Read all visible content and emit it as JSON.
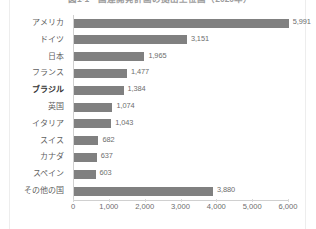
{
  "figure": {
    "title": "図1-1　国連開発計画の拠出上位国（2020年）",
    "title_clipped": true,
    "bar_color": "#808080",
    "axis_color": "#d0d0d0",
    "highlight_category": "ブラジル"
  },
  "chart_data": {
    "type": "bar",
    "orientation": "horizontal",
    "title": "図1-1　国連開発計画の拠出上位国（2020年）",
    "xlabel": "",
    "ylabel": "",
    "categories": [
      "アメリカ",
      "ドイツ",
      "日本",
      "フランス",
      "ブラジル",
      "英国",
      "イタリア",
      "スイス",
      "カナダ",
      "スペイン",
      "その他の国"
    ],
    "values": [
      5991,
      3151,
      1965,
      1477,
      1384,
      1074,
      1043,
      682,
      637,
      603,
      3880
    ],
    "value_labels": [
      "5,991",
      "3,151",
      "1,965",
      "1,477",
      "1,384",
      "1,074",
      "1,043",
      "682",
      "637",
      "603",
      "3,880"
    ],
    "xlim": [
      0,
      6000
    ],
    "xticks": [
      0,
      1000,
      2000,
      3000,
      4000,
      5000,
      6000
    ],
    "xtick_labels": [
      "0",
      "1,000",
      "2,000",
      "3,000",
      "4,000",
      "5,000",
      "6,000"
    ],
    "grid": false,
    "legend": null,
    "highlighted": [
      "ブラジル"
    ]
  }
}
